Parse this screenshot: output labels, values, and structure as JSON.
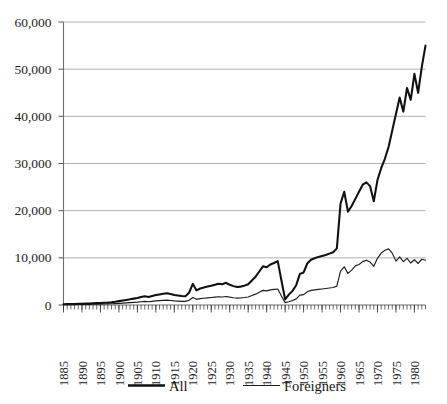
{
  "chart_data": {
    "type": "line",
    "title": "",
    "xlabel": "",
    "ylabel": "",
    "grid": "horizontal",
    "legend_position": "bottom",
    "xlim": [
      1885,
      1983
    ],
    "ylim": [
      0,
      60000
    ],
    "ytick_labels": [
      "60,000",
      "50,000",
      "40,000",
      "30,000",
      "20,000",
      "10,000",
      "0"
    ],
    "ytick_values": [
      60000,
      50000,
      40000,
      30000,
      20000,
      10000,
      0
    ],
    "xtick_labels": [
      "1885",
      "1890",
      "1895",
      "1900",
      "1905",
      "1910",
      "1915",
      "1920",
      "1925",
      "1930",
      "1935",
      "1940",
      "1945",
      "1950",
      "1955",
      "1960",
      "1965",
      "1970",
      "1975",
      "1980"
    ],
    "xtick_values": [
      1885,
      1890,
      1895,
      1900,
      1905,
      1910,
      1915,
      1920,
      1925,
      1930,
      1935,
      1940,
      1945,
      1950,
      1955,
      1960,
      1965,
      1970,
      1975,
      1980
    ],
    "minor_tick_interval": 1,
    "x": [
      1885,
      1886,
      1887,
      1888,
      1889,
      1890,
      1891,
      1892,
      1893,
      1894,
      1895,
      1896,
      1897,
      1898,
      1899,
      1900,
      1901,
      1902,
      1903,
      1904,
      1905,
      1906,
      1907,
      1908,
      1909,
      1910,
      1911,
      1912,
      1913,
      1914,
      1915,
      1916,
      1917,
      1918,
      1919,
      1920,
      1921,
      1922,
      1923,
      1924,
      1925,
      1926,
      1927,
      1928,
      1929,
      1930,
      1931,
      1932,
      1933,
      1934,
      1935,
      1936,
      1937,
      1938,
      1939,
      1940,
      1941,
      1942,
      1943,
      1944,
      1945,
      1946,
      1947,
      1948,
      1949,
      1950,
      1951,
      1952,
      1953,
      1954,
      1955,
      1956,
      1957,
      1958,
      1959,
      1960,
      1961,
      1962,
      1963,
      1964,
      1965,
      1966,
      1967,
      1968,
      1969,
      1970,
      1971,
      1972,
      1973,
      1974,
      1975,
      1976,
      1977,
      1978,
      1979,
      1980,
      1981,
      1982,
      1983
    ],
    "series": [
      {
        "name": "All",
        "line_width": "thick",
        "color": "#101010",
        "values": [
          180,
          200,
          210,
          230,
          250,
          280,
          300,
          330,
          360,
          400,
          430,
          470,
          520,
          600,
          700,
          820,
          950,
          1080,
          1200,
          1350,
          1500,
          1700,
          1850,
          1700,
          1900,
          2100,
          2250,
          2400,
          2500,
          2350,
          2100,
          2000,
          1900,
          1850,
          2600,
          4500,
          3100,
          3500,
          3700,
          3900,
          4100,
          4300,
          4500,
          4400,
          4700,
          4300,
          4000,
          3800,
          3900,
          4100,
          4400,
          5200,
          6000,
          7100,
          8200,
          8000,
          8600,
          8900,
          9300,
          5200,
          1200,
          2200,
          3000,
          4200,
          6600,
          6900,
          8800,
          9600,
          9900,
          10200,
          10400,
          10600,
          10900,
          11200,
          12000,
          21500,
          24000,
          19800,
          21000,
          22500,
          24000,
          25500,
          26000,
          25200,
          22000,
          26500,
          29000,
          31000,
          33500,
          37000,
          40500,
          44000,
          41000,
          46000,
          43500,
          49000,
          45000,
          50500,
          55000
        ]
      },
      {
        "name": "Foreigners",
        "line_width": "thin",
        "color": "#1b1b1b",
        "values": [
          60,
          70,
          75,
          85,
          95,
          110,
          120,
          135,
          150,
          170,
          185,
          205,
          230,
          260,
          300,
          350,
          400,
          450,
          500,
          560,
          620,
          700,
          760,
          700,
          780,
          860,
          920,
          980,
          1020,
          960,
          860,
          820,
          780,
          760,
          1000,
          1600,
          1200,
          1350,
          1420,
          1500,
          1580,
          1660,
          1740,
          1700,
          1810,
          1660,
          1540,
          1460,
          1500,
          1580,
          1700,
          2000,
          2300,
          2700,
          3100,
          3000,
          3200,
          3300,
          3400,
          1900,
          500,
          700,
          950,
          1300,
          2100,
          2200,
          2800,
          3100,
          3200,
          3300,
          3400,
          3500,
          3600,
          3700,
          4000,
          7200,
          8100,
          6700,
          7400,
          8300,
          8600,
          9200,
          9500,
          9100,
          8200,
          9900,
          11000,
          11600,
          11900,
          11000,
          9300,
          10200,
          9200,
          9900,
          8900,
          9600,
          8800,
          9700,
          9500
        ]
      }
    ],
    "legend": [
      {
        "label": "All",
        "style": "thick-line"
      },
      {
        "label": "Foreigners",
        "style": "thin-line"
      }
    ]
  }
}
